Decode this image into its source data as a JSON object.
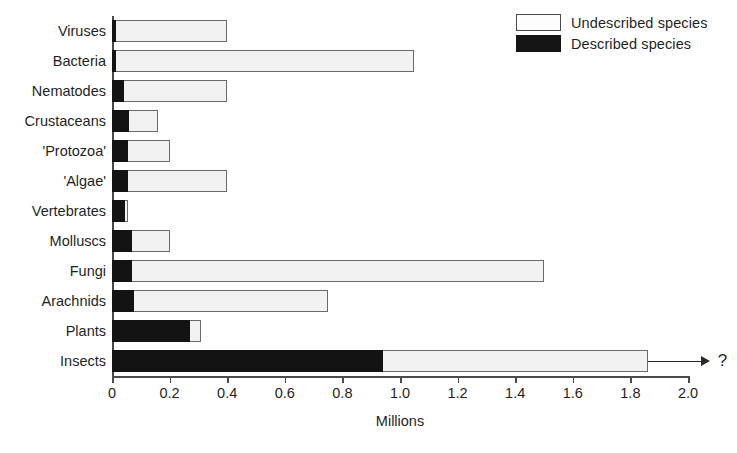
{
  "chart_data": {
    "type": "bar",
    "orientation": "horizontal",
    "stacked": true,
    "title": "",
    "xlabel": "Millions",
    "ylabel": "",
    "xlim": [
      0,
      2.0
    ],
    "xticks": [
      "0",
      "0.2",
      "0.4",
      "0.6",
      "0.8",
      "1.0",
      "1.2",
      "1.4",
      "1.6",
      "1.8",
      "2.0"
    ],
    "xtick_values": [
      0,
      0.2,
      0.4,
      0.6,
      0.8,
      1.0,
      1.2,
      1.4,
      1.6,
      1.8,
      2.0
    ],
    "grid": false,
    "legend_position": "top-right",
    "categories": [
      "Viruses",
      "Bacteria",
      "Nematodes",
      "Crustaceans",
      "'Protozoa'",
      "'Algae'",
      "Vertebrates",
      "Molluscs",
      "Fungi",
      "Arachnids",
      "Plants",
      "Insects"
    ],
    "series": [
      {
        "name": "Described species",
        "color": "#131313",
        "values": [
          0.014,
          0.014,
          0.04,
          0.06,
          0.055,
          0.055,
          0.045,
          0.07,
          0.07,
          0.075,
          0.27,
          0.94
        ]
      },
      {
        "name": "Undescribed species",
        "color": "#f2f2f2",
        "values": [
          0.386,
          1.036,
          0.36,
          0.1,
          0.145,
          0.345,
          0.01,
          0.13,
          1.43,
          0.675,
          0.04,
          0.92
        ]
      }
    ],
    "totals": [
      0.4,
      1.05,
      0.4,
      0.16,
      0.2,
      0.4,
      0.055,
      0.2,
      1.5,
      0.75,
      0.31,
      1.86
    ],
    "annotations": [
      {
        "category": "Insects",
        "symbol": "?",
        "marker": "arrow-right",
        "note": "bar extends beyond axis; total uncertain"
      }
    ]
  },
  "legend": {
    "items": [
      {
        "label": "Undescribed species",
        "swatch": "undescribed"
      },
      {
        "label": "Described species",
        "swatch": "described"
      }
    ]
  }
}
